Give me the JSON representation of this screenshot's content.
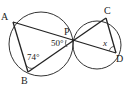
{
  "diagram": {
    "type": "geometry",
    "points": {
      "A": {
        "label": "A",
        "x": 13,
        "y": 22
      },
      "B": {
        "label": "B",
        "x": 28,
        "y": 72
      },
      "P": {
        "label": "P",
        "x": 73,
        "y": 42
      },
      "C": {
        "label": "C",
        "x": 106,
        "y": 18
      },
      "D": {
        "label": "D",
        "x": 116,
        "y": 53
      }
    },
    "circles": [
      {
        "name": "left-circle",
        "cx": 41,
        "cy": 44,
        "r": 32
      },
      {
        "name": "right-circle",
        "cx": 97,
        "cy": 45,
        "r": 24
      }
    ],
    "segments": [
      "AP",
      "PD",
      "AB",
      "BP",
      "PC",
      "CD"
    ],
    "angles": {
      "angle_APB": {
        "label": "50°"
      },
      "angle_ABP": {
        "label": "74°"
      },
      "angle_CDP": {
        "label": "x"
      }
    }
  }
}
